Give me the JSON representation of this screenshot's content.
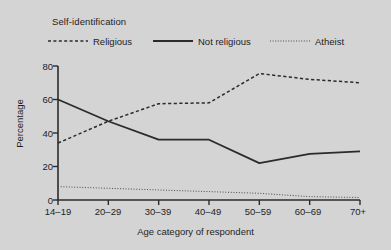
{
  "chart_data": {
    "type": "line",
    "title": "",
    "legend_title": "Self-identification",
    "legend_position": "top",
    "xlabel": "Age category of respondent",
    "ylabel": "Percentage",
    "categories": [
      "14–19",
      "20–29",
      "30–39",
      "40–49",
      "50–59",
      "60–69",
      "70+"
    ],
    "ylim": [
      0,
      80
    ],
    "yticks": [
      "0",
      "20",
      "40",
      "60",
      "80"
    ],
    "ytick_values": [
      0,
      20,
      40,
      60,
      80
    ],
    "grid": false,
    "series": [
      {
        "name": "Religious",
        "style": "dashed",
        "color": "#2b2b2b",
        "values": [
          34,
          47,
          57.5,
          58,
          75.5,
          72,
          70
        ]
      },
      {
        "name": "Not religious",
        "style": "solid",
        "color": "#2b2b2b",
        "values": [
          60,
          47,
          36,
          36,
          22,
          27.5,
          29
        ]
      },
      {
        "name": "Atheist",
        "style": "dotted",
        "color": "#4a4a4a",
        "values": [
          8,
          7,
          6,
          5,
          4,
          2,
          1.5
        ]
      }
    ]
  },
  "style": {
    "background": "#d4d4d4",
    "axis_color": "#2b2b2b",
    "text_color": "#1e1e1e"
  }
}
